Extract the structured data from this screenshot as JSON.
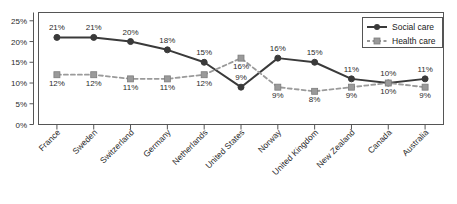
{
  "chart_data": {
    "type": "line",
    "title": "",
    "xlabel": "",
    "ylabel": "",
    "ylim": [
      0,
      27
    ],
    "grid": false,
    "legend_position": "top-right",
    "value_labels": true,
    "ytick_labels": [
      "0%",
      "5%",
      "10%",
      "15%",
      "20%",
      "25%"
    ],
    "ytick_values": [
      0,
      5,
      10,
      15,
      20,
      25
    ],
    "categories": [
      "France",
      "Sweden",
      "Switzerland",
      "Germany",
      "Netherlands",
      "United States",
      "Norway",
      "United Kingdom",
      "New Zealand",
      "Canada",
      "Australia"
    ],
    "series": [
      {
        "name": "Social care",
        "color": "#3a3a3a",
        "marker": "circle",
        "linestyle": "solid",
        "values": [
          21,
          21,
          20,
          18,
          15,
          9,
          16,
          15,
          11,
          10,
          11
        ],
        "labels": [
          "21%",
          "21%",
          "20%",
          "18%",
          "15%",
          "9%",
          "16%",
          "15%",
          "11%",
          "10%",
          "11%"
        ]
      },
      {
        "name": "Health care",
        "color": "#9a9a9a",
        "marker": "square",
        "linestyle": "dashed",
        "values": [
          12,
          12,
          11,
          11,
          12,
          16,
          9,
          8,
          9,
          10,
          9
        ],
        "labels": [
          "12%",
          "12%",
          "11%",
          "11%",
          "12%",
          "16%",
          "9%",
          "8%",
          "9%",
          "10%",
          "9%"
        ]
      }
    ]
  },
  "legend": {
    "items": [
      {
        "label": "Social care"
      },
      {
        "label": "Health care"
      }
    ]
  }
}
